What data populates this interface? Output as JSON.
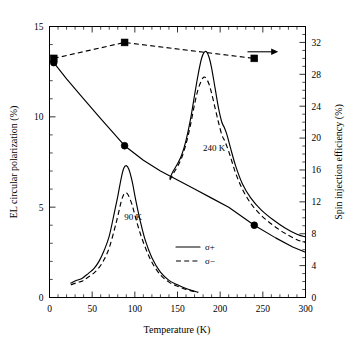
{
  "chart_data": {
    "type": "line",
    "title": "",
    "xlabel": "Temperature (K)",
    "ylabel": "EL circular polarization (%)",
    "y2label": "Spin injection efficiency (%)",
    "xlim": [
      0,
      300
    ],
    "ylim": [
      0,
      15
    ],
    "y2lim": [
      0,
      34
    ],
    "grid": false,
    "legend_position": "center-right",
    "xticks": [
      0,
      50,
      100,
      150,
      200,
      250,
      300
    ],
    "xtick_labels": [
      "0",
      "50",
      "100",
      "150",
      "200",
      "250",
      "300"
    ],
    "xtick_minor_step": 10,
    "yticks": [
      0,
      5,
      10,
      15
    ],
    "ytick_labels": [
      "0",
      "5",
      "10",
      "15"
    ],
    "ytick_minor_step": 1,
    "y2ticks": [
      0,
      4,
      8,
      12,
      16,
      20,
      24,
      28,
      32
    ],
    "y2tick_labels": [
      "0",
      "4",
      "8",
      "12",
      "16",
      "20",
      "24",
      "28",
      "32"
    ],
    "y2tick_minor_step": 1,
    "legend": [
      {
        "label": "σ+",
        "style": "solid",
        "name": "sigma-plus"
      },
      {
        "label": "σ−",
        "style": "dashed",
        "name": "sigma-minus"
      }
    ],
    "annotations": [
      {
        "text": "240 K",
        "x": 193,
        "y": 8.1,
        "name": "peak-label-240k"
      },
      {
        "text": "90 K",
        "x": 98,
        "y": 4.3,
        "name": "peak-label-90k"
      }
    ],
    "arrow": {
      "name": "right-axis-arrow",
      "x_start": 232,
      "x_end": 268,
      "y": 13.6,
      "direction": "right",
      "meaning": "dashed squares series reads on right axis"
    },
    "series": [
      {
        "name": "spin-injection-efficiency",
        "label": "Spin injection efficiency",
        "axis": "right",
        "style": "dashed",
        "marker": "square",
        "x": [
          5,
          88,
          240
        ],
        "values": [
          30.0,
          32.0,
          30.0
        ]
      },
      {
        "name": "el-circular-polarization",
        "label": "EL circular polarization",
        "axis": "left",
        "style": "solid",
        "marker": "circle",
        "x": [
          5,
          88,
          240
        ],
        "values": [
          13.0,
          8.4,
          4.0
        ],
        "curve_x": [
          5,
          20,
          40,
          60,
          88,
          110,
          130,
          150,
          170,
          190,
          210,
          240,
          265,
          285,
          300
        ],
        "curve_y": [
          13.0,
          12.1,
          11.0,
          9.9,
          8.4,
          7.6,
          7.0,
          6.5,
          6.0,
          5.5,
          5.0,
          4.0,
          3.3,
          2.8,
          2.5
        ]
      },
      {
        "name": "spectrum-90k-sigma-plus",
        "label": "90 K σ+",
        "axis": "left",
        "style": "solid",
        "marker": "none",
        "curve_x": [
          25,
          32,
          38,
          42,
          46,
          52,
          58,
          64,
          70,
          76,
          80,
          84,
          87,
          90,
          93,
          97,
          101,
          106,
          112,
          120,
          130,
          140,
          150,
          160,
          170,
          174
        ],
        "curve_y": [
          0.8,
          0.95,
          1.05,
          1.2,
          1.35,
          1.6,
          2.0,
          2.6,
          3.4,
          4.7,
          5.6,
          6.6,
          7.15,
          7.3,
          7.1,
          6.4,
          5.4,
          4.3,
          3.2,
          2.2,
          1.4,
          0.95,
          0.7,
          0.5,
          0.35,
          0.3
        ]
      },
      {
        "name": "spectrum-90k-sigma-minus",
        "label": "90 K σ−",
        "axis": "left",
        "style": "dashed",
        "marker": "none",
        "curve_x": [
          25,
          32,
          38,
          42,
          46,
          52,
          58,
          64,
          70,
          76,
          80,
          84,
          87,
          90,
          93,
          97,
          101,
          106,
          112,
          120,
          130,
          140,
          150,
          160,
          170,
          174
        ],
        "curve_y": [
          0.7,
          0.82,
          0.9,
          1.02,
          1.15,
          1.35,
          1.65,
          2.1,
          2.75,
          3.75,
          4.5,
          5.3,
          5.7,
          5.8,
          5.6,
          5.1,
          4.4,
          3.6,
          2.8,
          1.95,
          1.25,
          0.85,
          0.62,
          0.45,
          0.32,
          0.27
        ]
      },
      {
        "name": "spectrum-240k-sigma-plus",
        "label": "240 K σ+",
        "axis": "left",
        "style": "solid",
        "marker": "none",
        "curve_x": [
          141,
          145,
          150,
          155,
          160,
          165,
          170,
          174,
          178,
          181,
          184,
          187,
          190,
          194,
          198,
          202,
          205,
          208,
          212,
          218,
          226,
          236,
          248,
          262,
          276,
          290,
          300
        ],
        "curve_y": [
          6.6,
          7.0,
          7.4,
          7.9,
          8.7,
          9.8,
          11.2,
          12.3,
          13.2,
          13.55,
          13.6,
          13.3,
          12.7,
          11.6,
          10.5,
          9.7,
          9.4,
          9.0,
          8.3,
          7.3,
          6.3,
          5.5,
          4.85,
          4.3,
          3.85,
          3.5,
          3.35
        ]
      },
      {
        "name": "spectrum-240k-sigma-minus",
        "label": "240 K σ−",
        "axis": "left",
        "style": "dashed",
        "marker": "none",
        "curve_x": [
          141,
          145,
          150,
          155,
          160,
          165,
          170,
          174,
          178,
          181,
          184,
          187,
          190,
          194,
          198,
          202,
          205,
          208,
          212,
          218,
          226,
          236,
          248,
          262,
          276,
          290,
          300
        ],
        "curve_y": [
          6.5,
          6.85,
          7.25,
          7.75,
          8.5,
          9.5,
          10.7,
          11.5,
          12.0,
          12.2,
          12.1,
          11.8,
          11.3,
          10.5,
          9.7,
          9.0,
          8.7,
          8.35,
          7.8,
          6.9,
          6.0,
          5.2,
          4.55,
          4.0,
          3.55,
          3.2,
          3.05
        ]
      }
    ]
  }
}
